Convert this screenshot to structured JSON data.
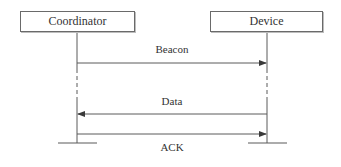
{
  "diagram": {
    "type": "sequence",
    "actors": [
      {
        "id": "coordinator",
        "label": "Coordinator"
      },
      {
        "id": "device",
        "label": "Device"
      }
    ],
    "messages": [
      {
        "label": "Beacon",
        "from": "Coordinator",
        "to": "Device"
      },
      {
        "label": "Data",
        "from": "Device",
        "to": "Coordinator"
      },
      {
        "label": "ACK",
        "from": "Coordinator",
        "to": "Device"
      }
    ],
    "colors": {
      "line": "#5a5a5a",
      "text": "#333333",
      "box_border": "#6a6a6a"
    }
  }
}
